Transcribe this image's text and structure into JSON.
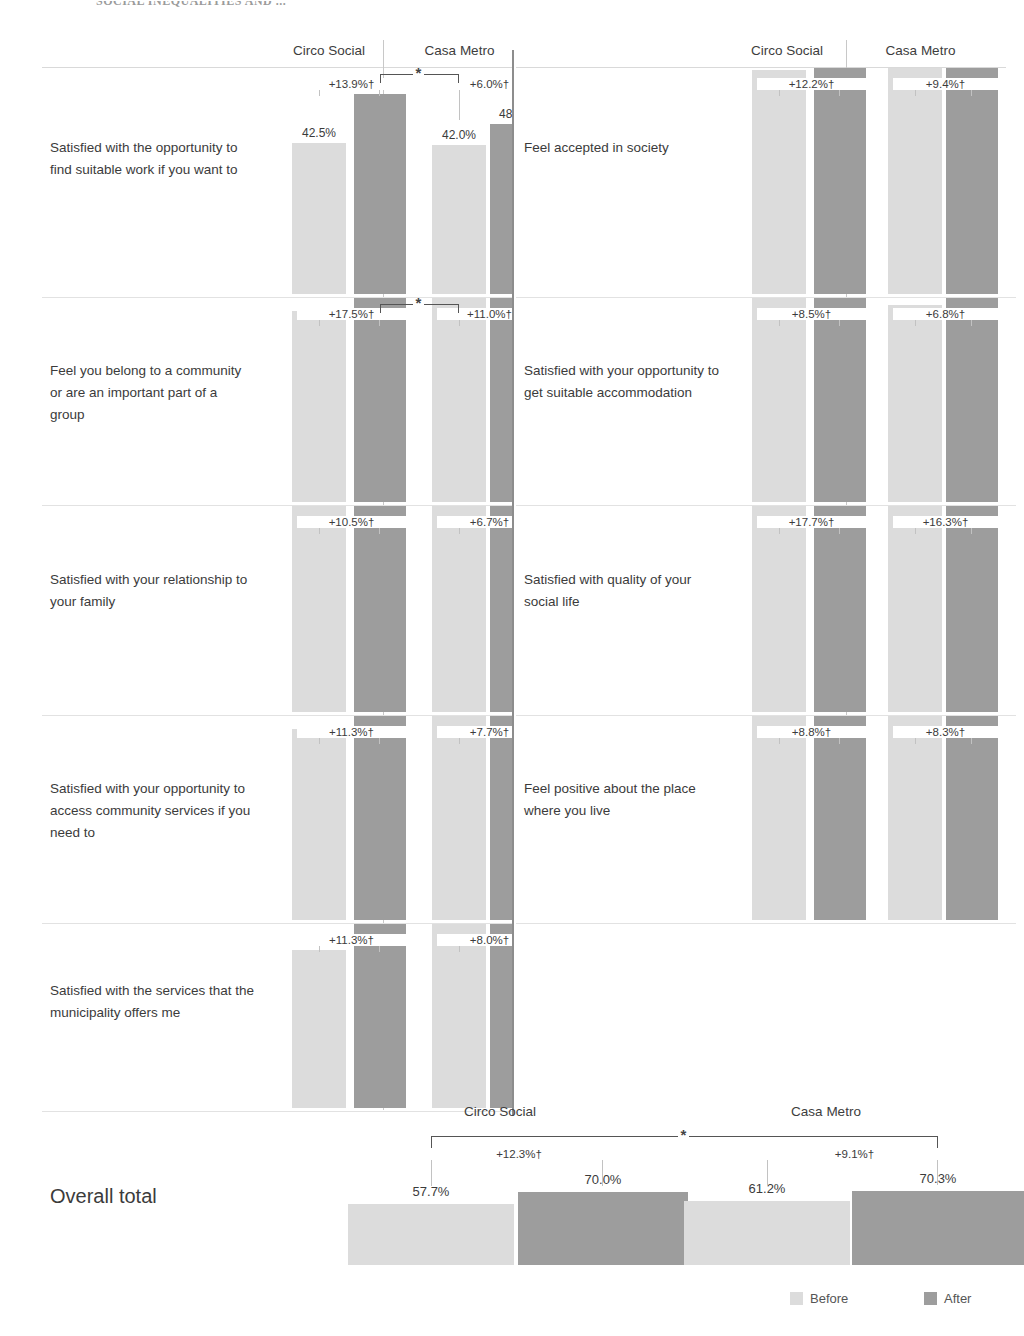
{
  "page_title": "SOCIAL INEQUALITIES AND ...",
  "columns": {
    "left": "Circo Social",
    "right": "Casa Metro"
  },
  "legend": {
    "before": "Before",
    "after": "After"
  },
  "overall": {
    "label": "Overall total",
    "header_left": "Circo Social",
    "header_right": "Casa Metro"
  },
  "chart_data": {
    "type": "bar",
    "title": "SOCIAL INEQUALITIES AND ...",
    "xlabel": "",
    "ylabel": "",
    "ylim": [
      0,
      100
    ],
    "grid": false,
    "legend_position": "bottom-right",
    "series": [
      {
        "name": "Before",
        "color": "#dcdcdc"
      },
      {
        "name": "After",
        "color": "#9d9d9d"
      }
    ],
    "groups": [
      "Circo Social",
      "Casa Metro"
    ],
    "annotations_note": "† = significant within-programme change; * = significant difference between programmes",
    "items": [
      {
        "id": "suitable-work",
        "label": "Satisfied with the opportunity to find suitable work if you want to",
        "side": "left",
        "row": 0,
        "circo": {
          "before": 42.5,
          "after": 56.4,
          "delta": "+13.9%†",
          "before_label": "42.5%",
          "after_label": "56.4%"
        },
        "casa": {
          "before": 42.0,
          "after": 48.0,
          "delta": "+6.0%†",
          "before_label": "42.0%",
          "after_label": "48.0%"
        },
        "between_sig": "*"
      },
      {
        "id": "belong-community",
        "label": "Feel you belong to a community or are an important part of a group",
        "side": "left",
        "row": 1,
        "circo": {
          "before": 53.8,
          "after": 71.3,
          "delta": "+17.5%†",
          "before_label": "53.8%",
          "after_label": "71.3%"
        },
        "casa": {
          "before": 58.1,
          "after": 69.1,
          "delta": "+11.0%†",
          "before_label": "58.1%",
          "after_label": "69.1%"
        },
        "between_sig": "*"
      },
      {
        "id": "family-relationship",
        "label": "Satisfied with your relationship to your family",
        "side": "left",
        "row": 2,
        "circo": {
          "before": 68.9,
          "after": 79.4,
          "delta": "+10.5%†",
          "before_label": "68.9%",
          "after_label": "79.4%"
        },
        "casa": {
          "before": 74.3,
          "after": 81.0,
          "delta": "+6.7%†",
          "before_label": "74.3%",
          "after_label": "81.0%"
        },
        "between_sig": ""
      },
      {
        "id": "community-services",
        "label": "Satisfied with your opportunity to access community services if you need to",
        "side": "left",
        "row": 3,
        "circo": {
          "before": 53.7,
          "after": 65.0,
          "delta": "+11.3%†",
          "before_label": "53.7%",
          "after_label": "65.0%"
        },
        "casa": {
          "before": 58.5,
          "after": 66.2,
          "delta": "+7.7%†",
          "before_label": "58.5%",
          "after_label": "66.2%"
        },
        "between_sig": ""
      },
      {
        "id": "municipality-services",
        "label": "Satisfied with the services that the municipality offers me",
        "side": "left",
        "row": 4,
        "circo": {
          "before": 44.4,
          "after": 55.7,
          "delta": "+11.3%†",
          "before_label": "44.4%",
          "after_label": "55.7%"
        },
        "casa": {
          "before": 63.9,
          "after": 71.9,
          "delta": "+8.0%†",
          "before_label": "63.9%",
          "after_label": "71.9%"
        },
        "between_sig": ""
      },
      {
        "id": "accepted-society",
        "label": "Feel accepted in society",
        "side": "right",
        "row": 0,
        "circo": {
          "before": 63.2,
          "after": 75.4,
          "delta": "+12.2%†",
          "before_label": "63.2%",
          "after_label": "75.4%"
        },
        "casa": {
          "before": 67.9,
          "after": 77.3,
          "delta": "+9.4%†",
          "before_label": "67.9%",
          "after_label": "77.3%"
        },
        "between_sig": ""
      },
      {
        "id": "suitable-accommodation",
        "label": "Satisfied with your opportunity to get suitable accommodation",
        "side": "right",
        "row": 1,
        "circo": {
          "before": 59.0,
          "after": 67.5,
          "delta": "+8.5%†",
          "before_label": "59.0%",
          "after_label": "67.5%"
        },
        "casa": {
          "before": 55.6,
          "after": 62.4,
          "delta": "+6.8%†",
          "before_label": "55.6%",
          "after_label": "62.4%"
        },
        "between_sig": ""
      },
      {
        "id": "social-life",
        "label": "Satisfied with quality of your social life",
        "side": "right",
        "row": 2,
        "circo": {
          "before": 60.1,
          "after": 77.8,
          "delta": "+17.7%†",
          "before_label": "60.1%",
          "after_label": "77.8%"
        },
        "casa": {
          "before": 59.9,
          "after": 76.2,
          "delta": "+16.3%†",
          "before_label": "59.9%",
          "after_label": "76.2%"
        },
        "between_sig": ""
      },
      {
        "id": "place-where-you-live",
        "label": "Feel positive about the place where you live",
        "side": "right",
        "row": 3,
        "circo": {
          "before": 63.5,
          "after": 72.3,
          "delta": "+8.8%†",
          "before_label": "63.5%",
          "after_label": "72.3%"
        },
        "casa": {
          "before": 67.3,
          "after": 75.6,
          "delta": "+8.3%†",
          "before_label": "67.3%",
          "after_label": "75.6%"
        },
        "between_sig": ""
      }
    ],
    "overall_total": {
      "label": "Overall total",
      "circo": {
        "before": 57.7,
        "after": 70.0,
        "delta": "+12.3%†",
        "before_label": "57.7%",
        "after_label": "70.0%"
      },
      "casa": {
        "before": 61.2,
        "after": 70.3,
        "delta": "+9.1%†",
        "before_label": "61.2%",
        "after_label": "70.3%"
      },
      "between_sig": "*"
    }
  }
}
